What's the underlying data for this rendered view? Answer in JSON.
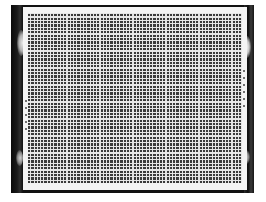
{
  "image": {
    "subject": "sensor-array-photo",
    "description_visible": "Rectangular grid array on a white plate mounted in a dark frame"
  },
  "colors": {
    "frame": "#111111",
    "plate": "#f4f4f4",
    "grid_cell": "#3a3a3a",
    "grid_line": "#e6e6e6",
    "background": "#ffffff"
  }
}
